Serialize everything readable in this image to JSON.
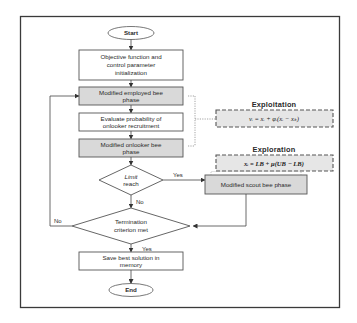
{
  "diagram": {
    "type": "flowchart",
    "title": "",
    "colors": {
      "frame": "#3a3a3a",
      "process_fill": "#ffffff",
      "highlight_fill": "#d9d9d9",
      "formula_fill": "#e6e6e6",
      "line": "#444444"
    },
    "nodes": {
      "start": {
        "label": "Start",
        "shape": "terminator"
      },
      "init": {
        "lines": [
          "Objective function and",
          "control parameter",
          "initialization"
        ],
        "shape": "process"
      },
      "employed": {
        "lines": [
          "Modified employed bee",
          "phase"
        ],
        "shape": "process",
        "highlighted": true
      },
      "evaluate": {
        "lines": [
          "Evaluate probability of",
          "onlooker recruitment"
        ],
        "shape": "process"
      },
      "onlooker": {
        "lines": [
          "Modified onlooker bee",
          "phase"
        ],
        "shape": "process",
        "highlighted": true
      },
      "limit": {
        "lines": [
          "Limit",
          "reach"
        ],
        "shape": "decision"
      },
      "scout": {
        "label": "Modified scout bee phase",
        "shape": "process",
        "highlighted": true
      },
      "termination": {
        "lines": [
          "Termination",
          "criterion met"
        ],
        "shape": "decision"
      },
      "save": {
        "lines": [
          "Save best solution in",
          "memory"
        ],
        "shape": "process"
      },
      "end": {
        "label": "End",
        "shape": "terminator"
      }
    },
    "annotations": {
      "exploitation": {
        "title": "Exploitation",
        "formula": "vᵢ = xᵢ + φᵢ(xᵢ − xₖ)"
      },
      "exploration": {
        "title": "Exploration",
        "formula": "xᵢ = LB + μ(UB − LB)"
      }
    },
    "edge_labels": {
      "limit_yes": "Yes",
      "limit_no": "No",
      "termination_no": "No",
      "termination_yes": "Yes"
    },
    "edges": [
      {
        "from": "start",
        "to": "init"
      },
      {
        "from": "init",
        "to": "employed"
      },
      {
        "from": "employed",
        "to": "evaluate"
      },
      {
        "from": "evaluate",
        "to": "onlooker"
      },
      {
        "from": "onlooker",
        "to": "limit"
      },
      {
        "from": "limit",
        "to": "scout",
        "label": "Yes"
      },
      {
        "from": "limit",
        "to": "termination",
        "label": "No"
      },
      {
        "from": "scout",
        "to": "termination"
      },
      {
        "from": "termination",
        "to": "employed",
        "label": "No"
      },
      {
        "from": "termination",
        "to": "save",
        "label": "Yes"
      },
      {
        "from": "save",
        "to": "end"
      }
    ]
  }
}
